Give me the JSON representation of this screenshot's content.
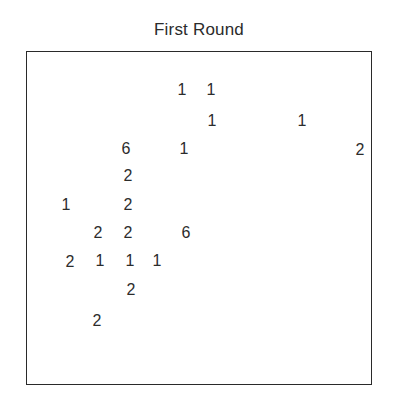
{
  "title": "First Round",
  "chart_data": {
    "type": "table",
    "title": "First Round",
    "points": [
      {
        "value": "1",
        "x": 182,
        "y": 91
      },
      {
        "value": "1",
        "x": 211,
        "y": 91
      },
      {
        "value": "1",
        "x": 212,
        "y": 122
      },
      {
        "value": "1",
        "x": 302,
        "y": 122
      },
      {
        "value": "6",
        "x": 126,
        "y": 150
      },
      {
        "value": "1",
        "x": 184,
        "y": 150
      },
      {
        "value": "2",
        "x": 360,
        "y": 151
      },
      {
        "value": "2",
        "x": 128,
        "y": 177
      },
      {
        "value": "1",
        "x": 66,
        "y": 206
      },
      {
        "value": "2",
        "x": 128,
        "y": 206
      },
      {
        "value": "2",
        "x": 98,
        "y": 234
      },
      {
        "value": "2",
        "x": 128,
        "y": 234
      },
      {
        "value": "6",
        "x": 186,
        "y": 234
      },
      {
        "value": "2",
        "x": 70,
        "y": 263
      },
      {
        "value": "1",
        "x": 100,
        "y": 262
      },
      {
        "value": "1",
        "x": 130,
        "y": 262
      },
      {
        "value": "1",
        "x": 157,
        "y": 262
      },
      {
        "value": "2",
        "x": 131,
        "y": 291
      },
      {
        "value": "2",
        "x": 97,
        "y": 322
      }
    ],
    "xlabel": "",
    "ylabel": "",
    "grid": false,
    "legend": null
  }
}
